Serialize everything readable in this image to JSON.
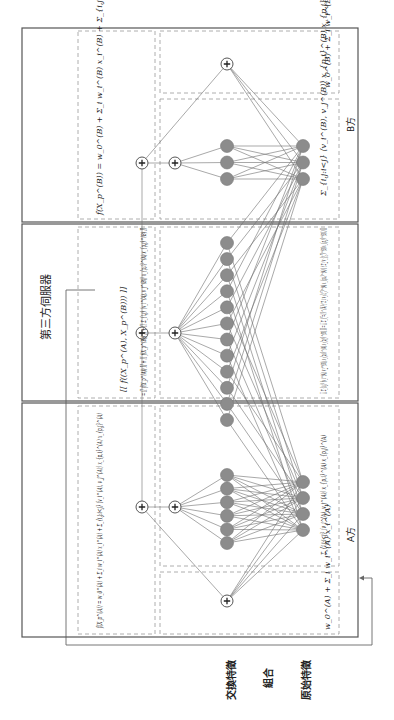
{
  "figure": {
    "orientation": "rotated-90-clockwise",
    "colors": {
      "frame": "#555555",
      "dashed_box": "#9a9a9a",
      "node_fill": "#8c8c8c",
      "edge": "#6e6e6e",
      "background": "#ffffff"
    }
  },
  "parties": {
    "party_b": {
      "label": "B方",
      "output_formula": "f(X_p^(B)) = w_0^(B) + Σ_i w_i^(B) x_i^(B) + Σ_{i,j:i<j} ⟨v_i^(B), v_j^(B)⟩ x_{p,i}^(B) x_{p,j}^(B)",
      "linear_formula": "w_0^(B) + Σ_i w_i^(B) x_i^(B)",
      "interaction_formula": "Σ_{i,j:i<j} ⟨v_i^(B), v_j^(B)⟩ x_{p,i}^(B) x_{p,j}^(B)",
      "input_node_count": 3,
      "hidden_node_count": 3
    },
    "third_party": {
      "label": "第三方伺服器",
      "output_formula_line1": "[[ f((X_p^(A), X_p^(B))) ]]",
      "output_formula_line2": "= [[ f(X_p^(A)) ]] + [[ f(X_p^(B)) ]] + [[ Σ_{i,j} ⟨v_i^(A), v_j^(B)⟩ x_{p,i}^(A) x_{p,j}^(B) ]]",
      "interaction_formula": "[[ Σ_{i,j} ⟨v_i^(A), v_j^(B)⟩ x_{p,i}^(A) x_{p,j}^(B) ]] = [[ Σ_{f=1}^{k} ( Σ_i v_{i,f}^(A) x_{p,i}^(A) ) ( Σ_j v_{j,f}^(B) x_{p,j}^(B) ) ]]",
      "hidden_node_count": 12
    },
    "party_a": {
      "label": "A方",
      "output_formula": "f(X_p^(A)) = w_0^(A) + Σ_i w_i^(A) x_i^(A) + Σ_{i,j:i<j} ⟨v_i^(A), v_j^(A)⟩ x_{p,i}^(A) x_{p,j}^(A)",
      "linear_formula": "w_0^(A) + Σ_i w_i^(A) x_i^(A)",
      "interaction_formula": "Σ_{i,j:i<j} ⟨v_i^(A), v_j^(A)⟩ x_{p,i}^(A) x_{p,j}^(A)",
      "input_node_count": 4,
      "hidden_node_count": 6
    }
  },
  "layer_labels": {
    "cross_features": "交換特徵",
    "combination": "組合",
    "raw_features": "原始特徵"
  }
}
